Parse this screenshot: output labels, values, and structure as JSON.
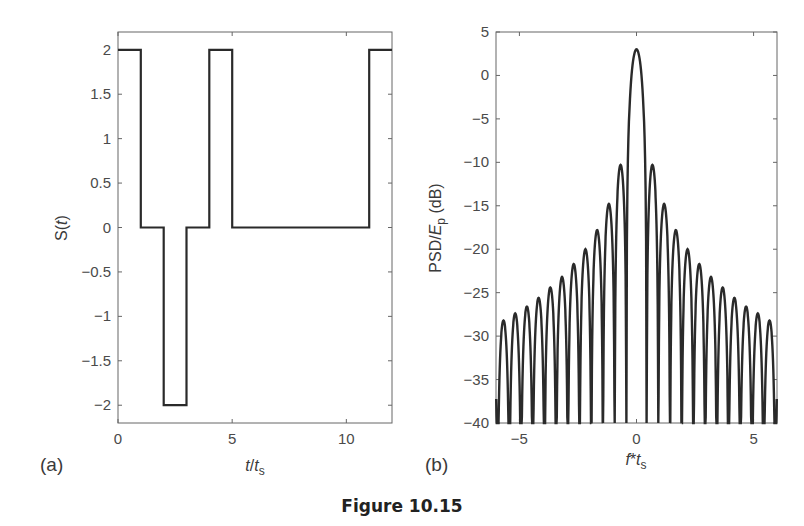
{
  "caption": "Figure 10.15",
  "chart_data": [
    {
      "type": "line",
      "panel": "(a)",
      "title": "",
      "xlabel": "t/t_s",
      "ylabel": "S(t)",
      "xlim": [
        0,
        12
      ],
      "ylim": [
        -2.2,
        2.2
      ],
      "xticks": [
        0,
        5,
        10
      ],
      "yticks": [
        2,
        1.5,
        1,
        0.5,
        0,
        -0.5,
        -1,
        -1.5,
        -2
      ],
      "ytick_labels": [
        "2",
        "1.5",
        "1",
        "0.5",
        "0",
        "−0.5",
        "−1",
        "−1.5",
        "−2"
      ],
      "grid": false,
      "step": true,
      "x": [
        0,
        1,
        1,
        2,
        2,
        3,
        3,
        4,
        4,
        5,
        5,
        11,
        11,
        12
      ],
      "y": [
        2,
        2,
        0,
        0,
        -2,
        -2,
        0,
        0,
        2,
        2,
        0,
        0,
        2,
        2
      ],
      "segments": [
        {
          "t0": 0,
          "t1": 1,
          "value": 2
        },
        {
          "t0": 1,
          "t1": 2,
          "value": 0
        },
        {
          "t0": 2,
          "t1": 3,
          "value": -2
        },
        {
          "t0": 3,
          "t1": 4,
          "value": 0
        },
        {
          "t0": 4,
          "t1": 5,
          "value": 2
        },
        {
          "t0": 5,
          "t1": 11,
          "value": 0
        },
        {
          "t0": 11,
          "t1": 12,
          "value": 2
        }
      ]
    },
    {
      "type": "line",
      "panel": "(b)",
      "title": "",
      "xlabel": "f*t_s",
      "ylabel": "PSD/E_p (dB)",
      "xlim": [
        -6,
        6
      ],
      "ylim": [
        -40,
        5
      ],
      "xticks": [
        -5,
        0,
        5
      ],
      "xtick_labels": [
        "−5",
        "0",
        "5"
      ],
      "yticks": [
        5,
        0,
        -5,
        -10,
        -15,
        -20,
        -25,
        -30,
        -35,
        -40
      ],
      "ytick_labels": [
        "5",
        "0",
        "−5",
        "−10",
        "−15",
        "−20",
        "−25",
        "−30",
        "−35",
        "−40"
      ],
      "grid": false,
      "main_lobe": {
        "f": 0,
        "peak_db": 3,
        "first_null": 0.43
      },
      "sidelobe_spacing": 0.5,
      "sidelobe_peaks": {
        "f": [
          0.68,
          1.18,
          1.68,
          2.18,
          2.68,
          3.18,
          3.68,
          4.18,
          4.68,
          5.18,
          5.68
        ],
        "db": [
          -10.3,
          -14.8,
          -17.8,
          -20.0,
          -21.7,
          -23.2,
          -24.4,
          -25.6,
          -26.6,
          -27.4,
          -28.2
        ]
      },
      "symmetric": true
    }
  ],
  "panels": {
    "a": {
      "label": "(a)",
      "ylabel_main": "S(",
      "ylabel_var": "t",
      "ylabel_end": ")",
      "xlabel_var": "t",
      "xlabel_sep": "/",
      "xlabel_sub_var": "t",
      "xlabel_sub": "s"
    },
    "b": {
      "label": "(b)",
      "ylabel_main": "PSD/",
      "ylabel_var": "E",
      "ylabel_sub": "p",
      "ylabel_end": " (dB)",
      "xlabel_var": "f",
      "xlabel_sep": "*",
      "xlabel_sub_var": "t",
      "xlabel_sub": "s"
    }
  },
  "colors": {
    "line": "#2a2a2a",
    "axes": "#555555",
    "text": "#3a3a3a"
  }
}
